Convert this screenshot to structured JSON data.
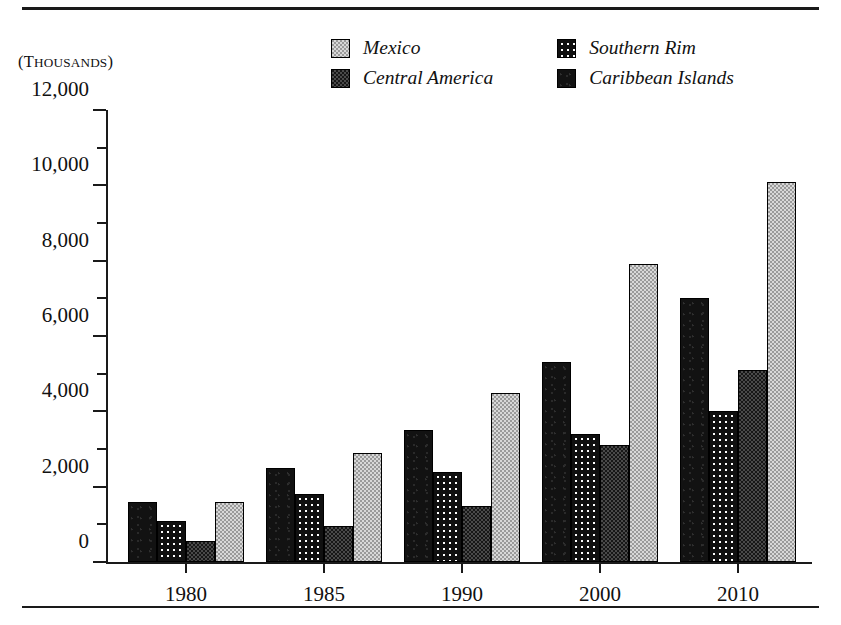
{
  "figure": {
    "units_caption": "(THOUSANDS)",
    "units_caption_first": "(T",
    "units_caption_rest": "HOUSANDS",
    "units_caption_close": ")"
  },
  "legend": {
    "items": [
      {
        "label": "Mexico",
        "swatch": "mexico-swatch-icon",
        "color": "#9a9a9a"
      },
      {
        "label": "Southern Rim",
        "swatch": "southern-rim-swatch-icon",
        "color": "#101010"
      },
      {
        "label": "Central America",
        "swatch": "central-america-swatch-icon",
        "color": "#171717"
      },
      {
        "label": "Caribbean Islands",
        "swatch": "caribbean-islands-swatch-icon",
        "color": "#121212"
      }
    ]
  },
  "chart_data": {
    "type": "bar",
    "title": "",
    "xlabel": "",
    "ylabel": "(THOUSANDS)",
    "ylim": [
      0,
      12000
    ],
    "ytick_step": 2000,
    "yminor_step": 1000,
    "grid": false,
    "legend_position": "top",
    "categories": [
      "1980",
      "1985",
      "1990",
      "2000",
      "2010"
    ],
    "ytick_labels": [
      "0",
      "2,000",
      "4,000",
      "6,000",
      "8,000",
      "10,000",
      "12,000"
    ],
    "bar_order": [
      "Caribbean Islands",
      "Southern Rim",
      "Central America",
      "Mexico"
    ],
    "series": [
      {
        "name": "Caribbean Islands",
        "values": [
          1600,
          2500,
          3500,
          5300,
          7000
        ]
      },
      {
        "name": "Southern Rim",
        "values": [
          1100,
          1800,
          2400,
          3400,
          4000
        ]
      },
      {
        "name": "Central America",
        "values": [
          550,
          950,
          1500,
          3100,
          5100
        ]
      },
      {
        "name": "Mexico",
        "values": [
          1600,
          2900,
          4500,
          7900,
          10100
        ]
      }
    ]
  }
}
